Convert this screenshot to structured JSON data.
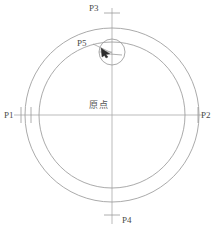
{
  "figure": {
    "type": "technical-line-drawing",
    "stroke_color": "#9a9a9a",
    "axis_color": "#a8a8a8",
    "marker_color": "#3a3a3a",
    "background_color": "#ffffff"
  },
  "labels": {
    "p1": "P1",
    "p2": "P2",
    "p3": "P3",
    "p4": "P4",
    "p5": "P5",
    "origin": "原点"
  },
  "geometry": {
    "center": {
      "x": 112,
      "y": 115
    },
    "outer_circle_radius": 87,
    "inner_circle_radius": 73,
    "small_circle": {
      "cx": 112,
      "cy": 52,
      "r": 13
    },
    "axis_horizontal": {
      "x1": 14,
      "x2": 203,
      "y": 115
    },
    "axis_vertical": {
      "x": 112,
      "y1": 8,
      "y2": 224
    },
    "tick_left_outer": {
      "x": 21,
      "y1": 107,
      "y2": 123
    },
    "tick_left_inner": {
      "x": 31,
      "y1": 107,
      "y2": 123
    },
    "tick_right": {
      "x": 198,
      "y1": 107,
      "y2": 123
    },
    "tick_top": {
      "y": 13,
      "x1": 104,
      "x2": 120
    },
    "tick_bottom": {
      "y": 215,
      "x1": 104,
      "x2": 120
    },
    "leader_line": {
      "x1": 93,
      "y1": 44,
      "x2": 112,
      "y2": 53
    },
    "arrow_tip": {
      "x": 104,
      "y": 51
    }
  }
}
